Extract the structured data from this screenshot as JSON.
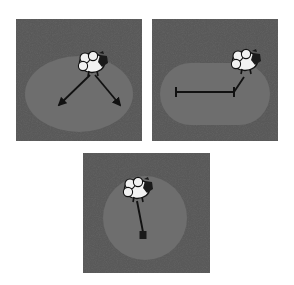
{
  "figure": {
    "title": "",
    "caption": "",
    "background_color": "#ffffff",
    "panel_count": 3
  },
  "colors": {
    "panel_background": "#565656",
    "region_fill": "#6e6e6e",
    "stroke_dark": "#111111",
    "animal_body": "#f2f2f2",
    "animal_outline": "#111111",
    "animal_head": "#1a1a1a"
  },
  "panels": [
    {
      "id": "panel-ellipse",
      "label": "a",
      "region_shape": "ellipse",
      "region_name": "elliptical-region",
      "animal": {
        "name": "sheep-figure",
        "x": 78,
        "y": 44,
        "facing": "right"
      },
      "annotations": [
        {
          "name": "arrow-down-left",
          "type": "arrow",
          "from": [
            74,
            56
          ],
          "to": [
            41,
            88
          ],
          "head": "end"
        },
        {
          "name": "arrow-down-right",
          "type": "arrow",
          "from": [
            79,
            56
          ],
          "to": [
            106,
            88
          ],
          "head": "end"
        }
      ]
    },
    {
      "id": "panel-stadium",
      "label": "b",
      "region_shape": "stadium",
      "region_name": "stadium-region",
      "animal": {
        "name": "sheep-figure",
        "x": 93,
        "y": 41,
        "facing": "right"
      },
      "annotations": [
        {
          "name": "measurement-bar",
          "type": "bar",
          "from": [
            24,
            73
          ],
          "to": [
            81,
            73
          ],
          "caps": "both"
        },
        {
          "name": "tether-segment",
          "type": "line",
          "from": [
            81,
            73
          ],
          "to": [
            92,
            58
          ]
        }
      ]
    },
    {
      "id": "panel-circle",
      "label": "c",
      "region_shape": "circle",
      "region_name": "circular-region",
      "animal": {
        "name": "sheep-figure",
        "x": 55,
        "y": 36,
        "facing": "right"
      },
      "annotations": [
        {
          "name": "tether-line",
          "type": "line",
          "from": [
            55,
            48
          ],
          "to": [
            60,
            80
          ]
        },
        {
          "name": "anchor-stake",
          "type": "square",
          "at": [
            60,
            82
          ],
          "size": 7
        }
      ]
    }
  ]
}
